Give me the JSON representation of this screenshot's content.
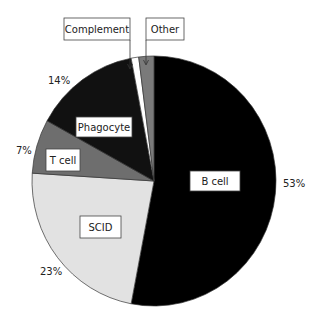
{
  "chart_data": {
    "type": "pie",
    "title": "",
    "start_angle_deg": 0,
    "direction": "clockwise",
    "slices": [
      {
        "label": "B cell",
        "value": 53,
        "pct_label": "53%",
        "color": "#000000"
      },
      {
        "label": "SCID",
        "value": 23,
        "pct_label": "23%",
        "color": "#e2e2e2"
      },
      {
        "label": "T cell",
        "value": 7,
        "pct_label": "7%",
        "color": "#6e6e6e"
      },
      {
        "label": "Phagocyte",
        "value": 14,
        "pct_label": "14%",
        "color": "#111111"
      },
      {
        "label": "Complement",
        "value": 1,
        "pct_label": "",
        "color": "#ffffff"
      },
      {
        "label": "Other",
        "value": 2,
        "pct_label": "",
        "color": "#7a7a7a"
      }
    ],
    "legend": "inline labels"
  },
  "labels": {
    "b_cell": "B cell",
    "scid": "SCID",
    "t_cell": "T cell",
    "phagocyte": "Phagocyte",
    "complement": "Complement",
    "other": "Other"
  },
  "percents": {
    "b_cell": "53%",
    "scid": "23%",
    "t_cell": "7%",
    "phagocyte": "14%"
  }
}
